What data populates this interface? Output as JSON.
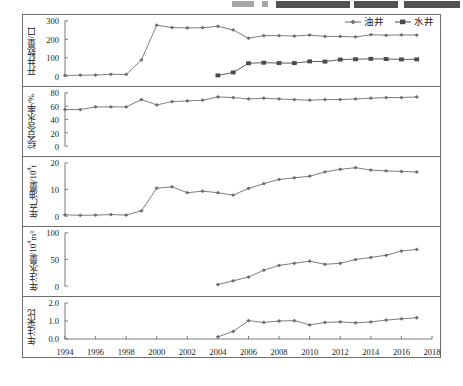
{
  "header_strip": {
    "note": "cut-off scanned running header, text illegible",
    "fragments": [
      {
        "left": 232,
        "width": 22,
        "type": "small"
      },
      {
        "left": 262,
        "width": 6,
        "type": "small"
      },
      {
        "left": 276,
        "width": 74,
        "type": "dark"
      },
      {
        "left": 354,
        "width": 44,
        "type": "dark"
      },
      {
        "left": 404,
        "width": 56,
        "type": "dark"
      }
    ]
  },
  "legend": {
    "items": [
      {
        "label": "油井",
        "marker": "diamond-marker",
        "color": "#6e6e78"
      },
      {
        "label": "水井",
        "marker": "square-marker",
        "color": "#4a4a52"
      }
    ]
  },
  "axis": {
    "x_label": "",
    "x_ticks": [
      1994,
      1996,
      1998,
      2000,
      2002,
      2004,
      2006,
      2008,
      2010,
      2012,
      2014,
      2016,
      2018
    ],
    "x_min": 1994,
    "x_max": 2018
  },
  "chart_data": [
    {
      "type": "line",
      "title": "",
      "panel_index": 0,
      "ylabel": "开井数量/口",
      "ylabel_main": "开井数量/口",
      "ylim": [
        0,
        300
      ],
      "yticks": [
        0,
        100,
        200,
        300
      ],
      "ytick_labels": [
        "0",
        "100",
        "200",
        "300"
      ],
      "xlabel": "",
      "grid": false,
      "legend_position": "top-right",
      "series": [
        {
          "name": "油井",
          "marker": "diamond",
          "color": "#6e6e78",
          "x": [
            1994,
            1995,
            1996,
            1997,
            1998,
            1999,
            2000,
            2001,
            2002,
            2003,
            2004,
            2005,
            2006,
            2007,
            2008,
            2009,
            2010,
            2011,
            2012,
            2013,
            2014,
            2015,
            2016,
            2017
          ],
          "values": [
            4,
            5,
            6,
            10,
            9,
            88,
            277,
            264,
            262,
            263,
            271,
            251,
            206,
            220,
            220,
            218,
            223,
            216,
            216,
            213,
            225,
            222,
            224,
            223
          ]
        },
        {
          "name": "水井",
          "marker": "square",
          "color": "#4a4a52",
          "x": [
            2004,
            2005,
            2006,
            2007,
            2008,
            2009,
            2010,
            2011,
            2012,
            2013,
            2014,
            2015,
            2016,
            2017
          ],
          "values": [
            4,
            20,
            70,
            73,
            71,
            71,
            80,
            79,
            90,
            92,
            94,
            93,
            91,
            91
          ]
        }
      ]
    },
    {
      "type": "line",
      "title": "",
      "panel_index": 1,
      "ylabel": "综合含水率/%",
      "ylabel_main": "综合含水率/%",
      "ylim": [
        0,
        80
      ],
      "yticks": [
        0,
        20,
        40,
        60,
        80
      ],
      "ytick_labels": [
        "0",
        "20",
        "40",
        "60",
        "80"
      ],
      "xlabel": "",
      "grid": false,
      "series": [
        {
          "name": "综合含水率",
          "marker": "diamond",
          "color": "#6e6e78",
          "x": [
            1994,
            1995,
            1996,
            1997,
            1998,
            1999,
            2000,
            2001,
            2002,
            2003,
            2004,
            2005,
            2006,
            2007,
            2008,
            2009,
            2010,
            2011,
            2012,
            2013,
            2014,
            2015,
            2016,
            2017
          ],
          "values": [
            55,
            55,
            59,
            59,
            59,
            70,
            62,
            67,
            68,
            69,
            74,
            73,
            71,
            72,
            71,
            70,
            69,
            70,
            70,
            71,
            72,
            73,
            73,
            74
          ]
        }
      ]
    },
    {
      "type": "line",
      "title": "",
      "panel_index": 2,
      "ylabel": "年产油量/10⁴t",
      "ylabel_main": "年产油量/10",
      "ylabel_sup": "4",
      "ylabel_tail": "t",
      "ylim": [
        0,
        20
      ],
      "yticks": [
        0,
        10,
        20
      ],
      "ytick_labels": [
        "0",
        "10",
        "20"
      ],
      "xlabel": "",
      "grid": false,
      "series": [
        {
          "name": "年产油量",
          "marker": "diamond",
          "color": "#6e6e78",
          "x": [
            1994,
            1995,
            1996,
            1997,
            1998,
            1999,
            2000,
            2001,
            2002,
            2003,
            2004,
            2005,
            2006,
            2007,
            2008,
            2009,
            2010,
            2011,
            2012,
            2013,
            2014,
            2015,
            2016,
            2017
          ],
          "values": [
            0.5,
            0.3,
            0.4,
            0.6,
            0.4,
            2.0,
            10.5,
            11.0,
            8.8,
            9.4,
            8.8,
            7.9,
            10.4,
            12.2,
            13.8,
            14.4,
            15.0,
            16.6,
            17.6,
            18.2,
            17.3,
            17.0,
            16.8,
            16.6
          ]
        }
      ]
    },
    {
      "type": "line",
      "title": "",
      "panel_index": 3,
      "ylabel": "年注水量/10⁴m³",
      "ylabel_main": "年注水量/10",
      "ylabel_sup": "4",
      "ylabel_tail": "m³",
      "ylim": [
        0,
        100
      ],
      "yticks": [
        0,
        50,
        100
      ],
      "ytick_labels": [
        "0",
        "50",
        "100"
      ],
      "xlabel": "",
      "grid": false,
      "series": [
        {
          "name": "年注水量",
          "marker": "diamond",
          "color": "#6e6e78",
          "x": [
            2004,
            2005,
            2006,
            2007,
            2008,
            2009,
            2010,
            2011,
            2012,
            2013,
            2014,
            2015,
            2016,
            2017
          ],
          "values": [
            3,
            10,
            17,
            30,
            39,
            43,
            47,
            41,
            43,
            50,
            54,
            58,
            66,
            69
          ]
        }
      ]
    },
    {
      "type": "line",
      "title": "",
      "panel_index": 4,
      "ylabel": "年注采比",
      "ylabel_main": "年注采比",
      "ylim": [
        0.0,
        2.0
      ],
      "yticks": [
        0.0,
        1.0,
        2.0
      ],
      "ytick_labels": [
        "0.0",
        "1.0",
        "2.0"
      ],
      "xlabel": "",
      "grid": false,
      "series": [
        {
          "name": "年注采比",
          "marker": "diamond",
          "color": "#6e6e78",
          "x": [
            2004,
            2005,
            2006,
            2007,
            2008,
            2009,
            2010,
            2011,
            2012,
            2013,
            2014,
            2015,
            2016,
            2017
          ],
          "values": [
            0.12,
            0.42,
            1.02,
            0.92,
            1.0,
            1.02,
            0.78,
            0.92,
            0.95,
            0.9,
            0.95,
            1.05,
            1.12,
            1.18
          ]
        }
      ]
    }
  ]
}
